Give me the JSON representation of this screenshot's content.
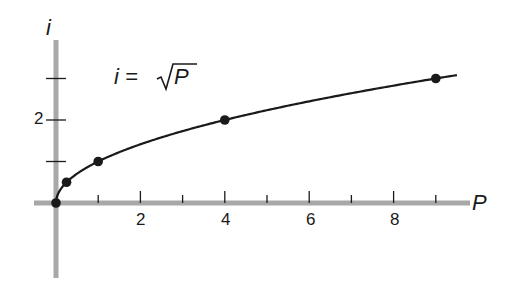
{
  "chart_data": {
    "type": "line",
    "title": "",
    "equation": "i = √P",
    "xlabel": "P",
    "ylabel": "i",
    "x_ticks": [
      1,
      2,
      3,
      4,
      5,
      6,
      7,
      8,
      9
    ],
    "x_tick_labels": [
      "2",
      "4",
      "6",
      "8"
    ],
    "y_ticks": [
      1,
      2,
      3
    ],
    "y_tick_labels": [
      "2"
    ],
    "xlim": [
      0,
      9.5
    ],
    "ylim": [
      0,
      3.6
    ],
    "grid": false,
    "series": [
      {
        "name": "i = √P",
        "x": [
          0,
          0.25,
          1,
          4,
          9
        ],
        "values": [
          0,
          0.5,
          1,
          2,
          3
        ],
        "markers": true
      }
    ],
    "colors": {
      "axis": "#a8a8a8",
      "line": "#1a1a1a",
      "marker": "#1a1a1a"
    }
  },
  "labels": {
    "y_axis": "i",
    "x_axis": "P",
    "equation_lhs": "i = ",
    "equation_rhs": "P",
    "tick_2": "2",
    "tick_4": "4",
    "tick_6": "6",
    "tick_8": "8",
    "ytick_2": "2"
  }
}
